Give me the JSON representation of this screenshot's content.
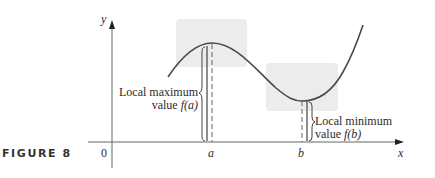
{
  "figure": {
    "caption": "FIGURE 8",
    "axes": {
      "x_label": "x",
      "y_label": "y",
      "origin_label": "0",
      "ticks": [
        "a",
        "b"
      ]
    },
    "annotations": {
      "local_max": {
        "line1": "Local maximum",
        "line2_prefix": "value ",
        "line2_func": "f(a)"
      },
      "local_min": {
        "line1": "Local minimum",
        "line2_prefix": "value ",
        "line2_func": "f(b)"
      }
    },
    "colors": {
      "curve": "#4a4a4a",
      "axis": "#555555",
      "highlight_box": "#ececec",
      "text": "#2b2b2b"
    }
  }
}
